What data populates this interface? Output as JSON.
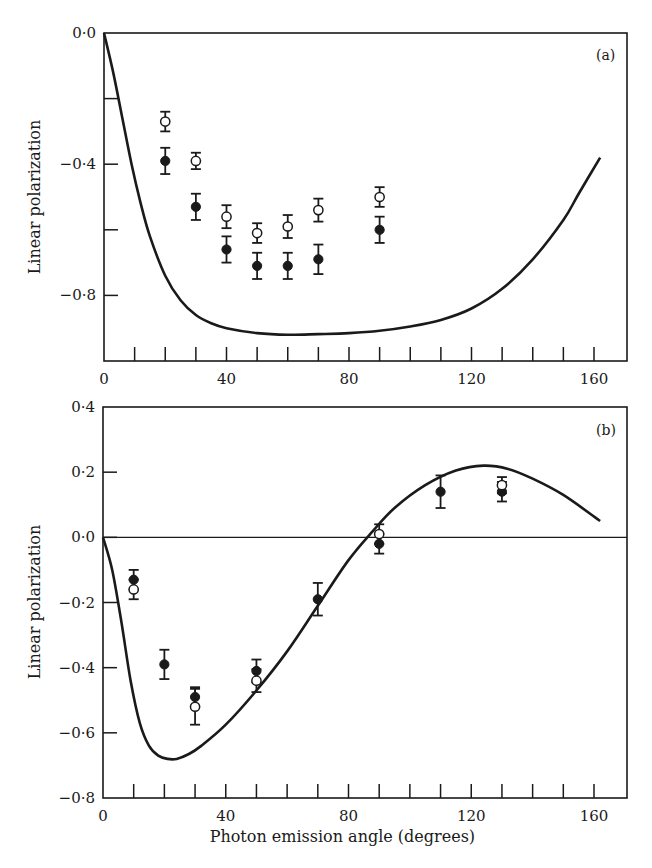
{
  "chart_data": [
    {
      "type": "scatter",
      "panel_label": "(a)",
      "title": "",
      "xlabel": "",
      "ylabel": "Linear polarization",
      "xlim": [
        0,
        170
      ],
      "ylim": [
        -1.0,
        0.0
      ],
      "x_ticks": [
        0,
        40,
        80,
        120,
        160
      ],
      "x_tick_labels": [
        "0",
        "40",
        "80",
        "120",
        "160"
      ],
      "x_minor_step": 10,
      "y_ticks": [
        0.0,
        -0.4,
        -0.8
      ],
      "y_tick_labels": [
        "0·0",
        "−0·4",
        "−0·8"
      ],
      "y_minor_step": 0.2,
      "grid": false,
      "legend": "none",
      "series": [
        {
          "name": "filled circles",
          "marker": "filled-circle",
          "x": [
            20,
            30,
            40,
            50,
            60,
            70,
            90
          ],
          "y": [
            -0.39,
            -0.53,
            -0.66,
            -0.71,
            -0.71,
            -0.69,
            -0.6
          ],
          "err": [
            0.04,
            0.04,
            0.04,
            0.04,
            0.04,
            0.045,
            0.04
          ]
        },
        {
          "name": "open circles",
          "marker": "open-circle",
          "x": [
            20,
            30,
            40,
            50,
            60,
            70,
            90
          ],
          "y": [
            -0.27,
            -0.39,
            -0.56,
            -0.61,
            -0.59,
            -0.54,
            -0.5
          ],
          "err": [
            0.03,
            0.025,
            0.035,
            0.03,
            0.035,
            0.035,
            0.03
          ]
        },
        {
          "name": "theory curve",
          "marker": "line",
          "x": [
            0,
            3,
            6,
            9,
            12,
            15,
            20,
            25,
            30,
            35,
            40,
            50,
            60,
            70,
            80,
            90,
            100,
            110,
            120,
            130,
            140,
            150,
            155,
            162
          ],
          "y": [
            0.0,
            -0.12,
            -0.26,
            -0.4,
            -0.52,
            -0.62,
            -0.74,
            -0.815,
            -0.86,
            -0.885,
            -0.9,
            -0.915,
            -0.92,
            -0.918,
            -0.915,
            -0.908,
            -0.895,
            -0.875,
            -0.84,
            -0.78,
            -0.69,
            -0.57,
            -0.49,
            -0.38
          ]
        }
      ]
    },
    {
      "type": "scatter",
      "panel_label": "(b)",
      "title": "",
      "xlabel": "Photon emission angle (degrees)",
      "ylabel": "Linear polarization",
      "xlim": [
        0,
        170
      ],
      "ylim": [
        -0.8,
        0.4
      ],
      "x_ticks": [
        0,
        40,
        80,
        120,
        160
      ],
      "x_tick_labels": [
        "0",
        "40",
        "80",
        "120",
        "160"
      ],
      "x_minor_step": 10,
      "y_ticks": [
        0.4,
        0.2,
        0.0,
        -0.2,
        -0.4,
        -0.6,
        -0.8
      ],
      "y_tick_labels": [
        "0·4",
        "0·2",
        "0·0",
        "−0·2",
        "−0·4",
        "−0·6",
        "−0·8"
      ],
      "zero_line": true,
      "grid": false,
      "legend": "none",
      "series": [
        {
          "name": "filled circles",
          "marker": "filled-circle",
          "x": [
            10,
            20,
            30,
            50,
            70,
            90,
            110,
            130
          ],
          "y": [
            -0.13,
            -0.39,
            -0.49,
            -0.41,
            -0.19,
            -0.02,
            0.14,
            0.14
          ],
          "err": [
            0.03,
            0.045,
            0.03,
            0.035,
            0.05,
            0.03,
            0.05,
            0.03
          ]
        },
        {
          "name": "open circles",
          "marker": "open-circle",
          "x": [
            10,
            30,
            50,
            90,
            130
          ],
          "y": [
            -0.16,
            -0.52,
            -0.44,
            0.01,
            0.16
          ],
          "err": [
            0.03,
            0.055,
            0.035,
            0.03,
            0.025
          ]
        },
        {
          "name": "theory curve",
          "marker": "line",
          "x": [
            0,
            3,
            6,
            9,
            12,
            15,
            18,
            21,
            24,
            28,
            32,
            40,
            50,
            60,
            70,
            80,
            88,
            95,
            105,
            115,
            124,
            132,
            140,
            150,
            162
          ],
          "y": [
            0.0,
            -0.1,
            -0.26,
            -0.44,
            -0.57,
            -0.64,
            -0.67,
            -0.68,
            -0.68,
            -0.665,
            -0.64,
            -0.575,
            -0.47,
            -0.35,
            -0.21,
            -0.07,
            0.02,
            0.09,
            0.16,
            0.205,
            0.22,
            0.21,
            0.18,
            0.13,
            0.05
          ]
        }
      ]
    }
  ],
  "panels": {
    "a": {
      "tag": "(a)",
      "ylabel": "Linear polarization"
    },
    "b": {
      "tag": "(b)",
      "ylabel": "Linear polarization",
      "xlabel": "Photon emission angle (degrees)"
    }
  }
}
